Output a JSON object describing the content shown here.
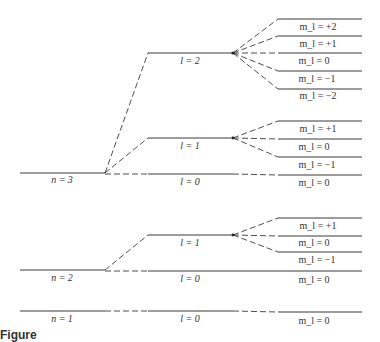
{
  "diagram": {
    "type": "energy-level splitting diagram",
    "line_color": "#3a3a3a",
    "n3": {
      "n_label": "n = 3",
      "l2": {
        "label": "l = 2",
        "ml": [
          "m_l = +2",
          "m_l = +1",
          "m_l = 0",
          "m_l = −1",
          "m_l = −2"
        ]
      },
      "l1": {
        "label": "l = 1",
        "ml": [
          "m_l = +1",
          "m_l = 0",
          "m_l = −1"
        ]
      },
      "l0": {
        "label": "l = 0",
        "ml": [
          "m_l = 0"
        ]
      }
    },
    "n2": {
      "n_label": "n = 2",
      "l1": {
        "label": "l = 1",
        "ml": [
          "m_l = +1",
          "m_l = 0",
          "m_l = −1"
        ]
      },
      "l0": {
        "label": "l = 0",
        "ml": [
          "m_l = 0"
        ]
      }
    },
    "n1": {
      "n_label": "n = 1",
      "l0": {
        "label": "l = 0",
        "ml": [
          "m_l = 0"
        ]
      }
    },
    "caption": "Figure"
  }
}
